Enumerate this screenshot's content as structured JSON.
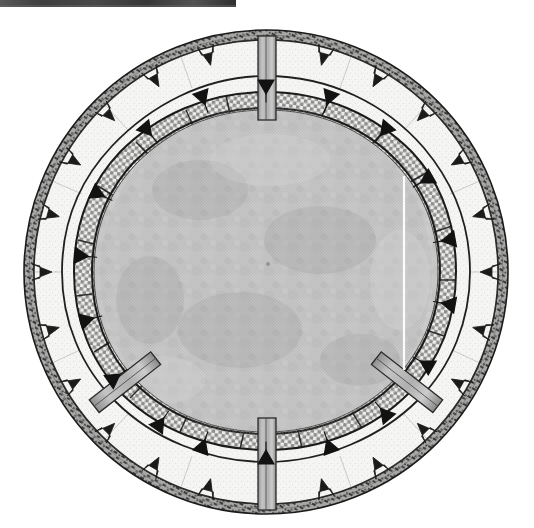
{
  "figure": {
    "title": "Circular structure plan",
    "background_color": "#ffffff",
    "ink_color": "#1b1b1b"
  },
  "geometry": {
    "center_x": 266,
    "center_y": 272,
    "outer_radius": 242,
    "rim_inner_radius": 232,
    "light_ring_inner_radius": 196,
    "checker_ring_inner_radius": 166,
    "inner_disc_radius": 166
  },
  "rings": [
    {
      "name": "outer-rim",
      "label": "Outer notched rim",
      "fill_color": "#9a9a9a",
      "stroke_color": "#1b1b1b",
      "pattern": "dark-speckled-band",
      "notch_count": 24
    },
    {
      "name": "light-ring",
      "label": "Light masonry ring",
      "fill_color": "#f4f4f2",
      "stroke_color": "#2a2a2a",
      "pattern": "fine-stipple",
      "marker_count": 18
    },
    {
      "name": "checker-ring",
      "label": "Cross-hatched ring",
      "fill_color": "#e2e2e0",
      "stroke_color": "#1b1b1b",
      "pattern": "checkerboard",
      "segment_count": 22
    },
    {
      "name": "inner-disc",
      "label": "Central shaded disc",
      "fill_color": "#c6c6c6",
      "stroke_color": "#4a4a4a",
      "pattern": "soft-mottled-grey"
    }
  ],
  "spokes": [
    {
      "name": "spoke-top",
      "label": "Radial beam N",
      "angle_deg": 270,
      "fill_color": "#b6b6b6",
      "stroke_color": "#2a2a2a"
    },
    {
      "name": "spoke-bottom",
      "label": "Radial beam S",
      "angle_deg": 90,
      "fill_color": "#b6b6b6",
      "stroke_color": "#2a2a2a"
    },
    {
      "name": "spoke-lower-left",
      "label": "Radial beam SW",
      "angle_deg": 152,
      "fill_color": "#b6b6b6",
      "stroke_color": "#2a2a2a"
    },
    {
      "name": "spoke-lower-right",
      "label": "Radial beam SE",
      "angle_deg": 28,
      "fill_color": "#b6b6b6",
      "stroke_color": "#2a2a2a"
    }
  ],
  "artifacts": [
    {
      "name": "top-scan-bar",
      "label": "Dark scan edge bar",
      "x": 0,
      "y": 0,
      "width": 236,
      "height": 7,
      "color": "#2e2e2e"
    },
    {
      "name": "scan-line",
      "label": "White vertical scan line",
      "x": 404,
      "y_start": 176,
      "y_end": 370,
      "color": "#ffffff"
    }
  ]
}
